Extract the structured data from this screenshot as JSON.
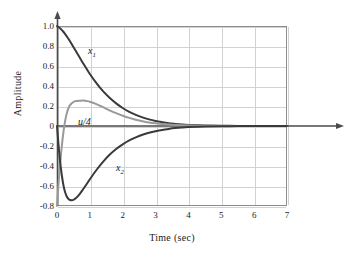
{
  "chart_data": {
    "type": "line",
    "title": "",
    "xlabel": "Time (sec)",
    "ylabel": "Amplitude",
    "xlim": [
      0,
      7
    ],
    "ylim": [
      -0.8,
      1.0
    ],
    "grid": true,
    "legend_position": "inline-annotations",
    "xticks": [
      "0",
      "1",
      "2",
      "3",
      "4",
      "5",
      "6",
      "7"
    ],
    "xtick_values": [
      0,
      1,
      2,
      3,
      4,
      5,
      6,
      7
    ],
    "yticks": [
      "1.0",
      "0.8",
      "0.6",
      "0.4",
      "0.2",
      "0",
      "-0.2",
      "-0.4",
      "-0.6",
      "-0.8"
    ],
    "ytick_values": [
      1.0,
      0.8,
      0.6,
      0.4,
      0.2,
      0,
      -0.2,
      -0.4,
      -0.6,
      -0.8
    ],
    "annotations": [
      {
        "text": "x1",
        "label_html": "x<sub>1</sub>",
        "x": 0.95,
        "y": 0.72
      },
      {
        "text": "u/4",
        "label_html": "u/4",
        "x": 0.65,
        "y": 0.03
      },
      {
        "text": "x2",
        "label_html": "x<sub>2</sub>",
        "x": 1.8,
        "y": -0.38
      }
    ],
    "series": [
      {
        "name": "x1",
        "color": "#3a3a3a",
        "linewidth": 2.0,
        "x": [
          0,
          0.1,
          0.2,
          0.3,
          0.4,
          0.5,
          0.6,
          0.7,
          0.8,
          0.9,
          1.0,
          1.2,
          1.4,
          1.6,
          1.8,
          2.0,
          2.2,
          2.4,
          2.6,
          2.8,
          3.0,
          3.2,
          3.4,
          3.6,
          3.8,
          4.0,
          4.5,
          5.0,
          5.5,
          6.0,
          6.5,
          7.0
        ],
        "values": [
          1.0,
          0.975,
          0.94,
          0.895,
          0.845,
          0.79,
          0.735,
          0.68,
          0.625,
          0.572,
          0.52,
          0.428,
          0.348,
          0.282,
          0.226,
          0.18,
          0.142,
          0.111,
          0.086,
          0.066,
          0.05,
          0.038,
          0.028,
          0.021,
          0.015,
          0.011,
          0.005,
          0.002,
          0.001,
          0.0,
          0.0,
          0.0
        ]
      },
      {
        "name": "u/4",
        "color": "#9a9a9a",
        "linewidth": 2.0,
        "x": [
          0,
          0.05,
          0.1,
          0.15,
          0.2,
          0.25,
          0.3,
          0.35,
          0.4,
          0.5,
          0.6,
          0.7,
          0.8,
          0.85,
          0.9,
          1.0,
          1.2,
          1.4,
          1.6,
          1.8,
          2.0,
          2.2,
          2.4,
          2.6,
          2.8,
          3.0,
          3.2,
          3.4,
          3.6,
          4.0,
          4.5,
          5.0,
          6.0,
          7.0
        ],
        "values": [
          -0.8,
          -0.56,
          -0.36,
          -0.19,
          -0.05,
          0.055,
          0.13,
          0.18,
          0.21,
          0.24,
          0.25,
          0.253,
          0.254,
          0.253,
          0.25,
          0.243,
          0.218,
          0.188,
          0.157,
          0.128,
          0.103,
          0.081,
          0.063,
          0.048,
          0.036,
          0.027,
          0.02,
          0.014,
          0.01,
          0.005,
          0.002,
          0.001,
          0.0,
          0.0
        ]
      },
      {
        "name": "x2",
        "color": "#3a3a3a",
        "linewidth": 2.0,
        "x": [
          0,
          0.05,
          0.1,
          0.15,
          0.2,
          0.25,
          0.3,
          0.35,
          0.4,
          0.45,
          0.5,
          0.55,
          0.6,
          0.7,
          0.8,
          0.9,
          1.0,
          1.2,
          1.4,
          1.6,
          1.8,
          2.0,
          2.2,
          2.4,
          2.6,
          2.8,
          3.0,
          3.2,
          3.4,
          3.6,
          3.8,
          4.0,
          4.5,
          5.0,
          5.5,
          6.0,
          6.5,
          7.0
        ],
        "values": [
          0.0,
          -0.2,
          -0.37,
          -0.5,
          -0.6,
          -0.665,
          -0.707,
          -0.73,
          -0.74,
          -0.742,
          -0.738,
          -0.728,
          -0.714,
          -0.676,
          -0.63,
          -0.582,
          -0.533,
          -0.44,
          -0.358,
          -0.288,
          -0.23,
          -0.183,
          -0.144,
          -0.113,
          -0.088,
          -0.068,
          -0.052,
          -0.039,
          -0.029,
          -0.021,
          -0.015,
          -0.011,
          -0.005,
          -0.002,
          -0.001,
          0.0,
          0.0,
          0.0
        ]
      }
    ]
  },
  "axis_decorations": {
    "y_axis_arrow": "arrow-up-icon",
    "x_axis_arrow": "arrow-right-icon",
    "x_axis_extends_to": 7.9
  }
}
